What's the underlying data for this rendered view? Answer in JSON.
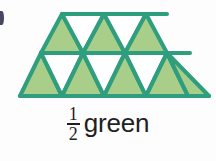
{
  "figure": {
    "name": "trapezoid-of-triangles",
    "shape": "trapezoid",
    "total_triangles": 12,
    "green_triangles": 6,
    "white_triangles": 6,
    "fill_color": "#a8ce8a",
    "stroke_color": "#2e9e7e",
    "background_color": "#fdfdfd",
    "rows": [
      {
        "row": "top",
        "count": 5,
        "triangles": [
          {
            "orientation": "up",
            "filled": true
          },
          {
            "orientation": "down",
            "filled": false
          },
          {
            "orientation": "up",
            "filled": true
          },
          {
            "orientation": "down",
            "filled": false
          },
          {
            "orientation": "up",
            "filled": true
          }
        ]
      },
      {
        "row": "bottom",
        "count": 7,
        "triangles": [
          {
            "orientation": "up",
            "filled": true
          },
          {
            "orientation": "down",
            "filled": false
          },
          {
            "orientation": "up",
            "filled": true
          },
          {
            "orientation": "down",
            "filled": false
          },
          {
            "orientation": "up",
            "filled": true
          },
          {
            "orientation": "down",
            "filled": false
          },
          {
            "orientation": "up",
            "filled": true
          }
        ]
      }
    ]
  },
  "caption": {
    "numerator": "1",
    "denominator": "2",
    "word": "green",
    "text_color": "#231f20"
  },
  "bullet": {
    "name": "list-bullet-cutoff",
    "color": "#2b2f4a"
  }
}
